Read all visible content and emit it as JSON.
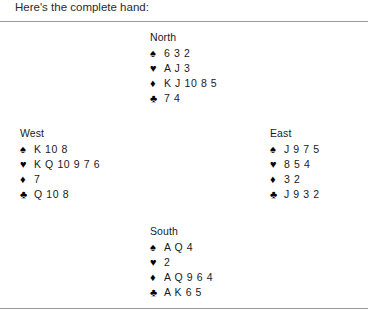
{
  "intro": {
    "text": "Here's the complete hand:"
  },
  "suits": {
    "spade": "♠",
    "heart": "♥",
    "diamond": "♦",
    "club": "♣"
  },
  "hands": {
    "north": {
      "label": "North",
      "spades": "6 3 2",
      "hearts": "A J 3",
      "diamonds": "K J 10 8 5",
      "clubs": "7 4"
    },
    "west": {
      "label": "West",
      "spades": "K 10 8",
      "hearts": "K Q 10 9 7 6",
      "diamonds": "7",
      "clubs": "Q 10 8"
    },
    "east": {
      "label": "East",
      "spades": "J 9 7 5",
      "hearts": "8 5 4",
      "diamonds": "3 2",
      "clubs": "J 9 3 2"
    },
    "south": {
      "label": "South",
      "spades": "A Q 4",
      "hearts": "2",
      "diamonds": "A Q 9 6 4",
      "clubs": "A K 6 5"
    }
  }
}
